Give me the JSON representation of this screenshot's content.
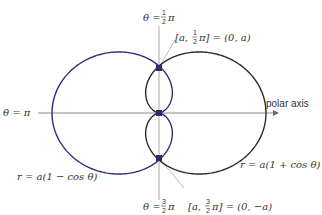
{
  "diagram": {
    "title": "",
    "pole": {
      "x": 159,
      "y": 113
    },
    "scale": {
      "ax": 53.5,
      "ay": 47
    },
    "colors": {
      "left_curve": "#2e2f7a",
      "right_curve": "#2a2a2a",
      "axis": "#9a9a9a",
      "point": "#2a2a6e",
      "text": "#333333"
    },
    "curves": [
      {
        "name": "left-cardioid",
        "equation": "r = a(1 − cos θ)",
        "label_parts": [
          "r = a(1 − cos θ)"
        ]
      },
      {
        "name": "right-cardioid",
        "equation": "r = a(1 + cos θ)",
        "label_parts": [
          "r = a(1 + cos θ)"
        ]
      }
    ],
    "labels": {
      "theta_half_pi": {
        "prefix": "θ = ",
        "num": "1",
        "den": "2",
        "suffix": "π"
      },
      "theta_three_half_pi": {
        "prefix": "θ = ",
        "num": "3",
        "den": "2",
        "suffix": "π"
      },
      "theta_pi": "θ = π",
      "polar_axis": "polar axis",
      "point_top": {
        "prefix": "[a,  ",
        "num": "1",
        "den": "2",
        "suffix": "π] = (0, a)"
      },
      "point_bottom": {
        "prefix": "[a,  ",
        "num": "3",
        "den": "2",
        "suffix": "π] = (0, −a)"
      },
      "left_curve_label": "r = a(1 − cos θ)",
      "right_curve_label": "r = a(1 + cos θ)"
    },
    "points": [
      {
        "name": "top-intersection",
        "coords": "(0, a)"
      },
      {
        "name": "pole",
        "coords": "(0, 0)"
      },
      {
        "name": "bottom-intersection",
        "coords": "(0, −a)"
      }
    ]
  }
}
